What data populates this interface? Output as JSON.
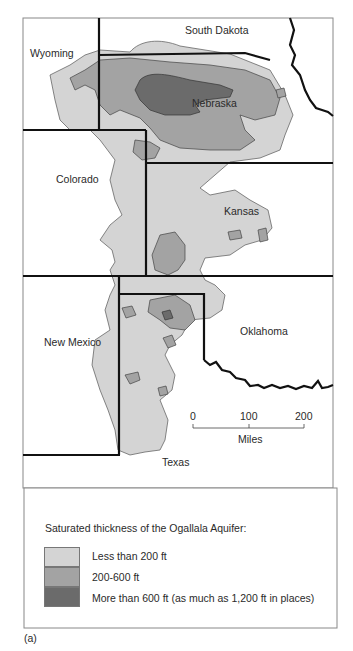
{
  "map": {
    "states": {
      "south_dakota": "South Dakota",
      "wyoming": "Wyoming",
      "nebraska": "Nebraska",
      "colorado": "Colorado",
      "kansas": "Kansas",
      "new_mexico": "New Mexico",
      "oklahoma": "Oklahoma",
      "texas": "Texas"
    },
    "scale": {
      "ticks": [
        "0",
        "100",
        "200"
      ],
      "unit": "Miles"
    }
  },
  "legend": {
    "title": "Saturated thickness of the Ogallala Aquifer:",
    "items": [
      {
        "label": "Less than 200 ft",
        "color": "#d4d4d4"
      },
      {
        "label": "200-600 ft",
        "color": "#a3a3a3"
      },
      {
        "label": "More than 600 ft (as much as 1,200 ft in places)",
        "color": "#6b6b6b"
      }
    ]
  },
  "caption": "(a)"
}
